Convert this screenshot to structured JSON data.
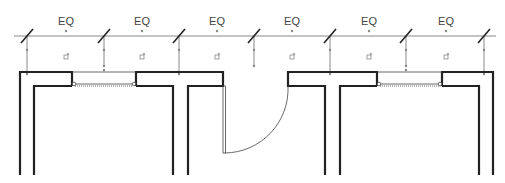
{
  "drawing": {
    "type": "architectural floor plan",
    "dimension_labels": [
      {
        "text": "EQ",
        "x": 66
      },
      {
        "text": "EQ",
        "x": 142
      },
      {
        "text": "EQ",
        "x": 217
      },
      {
        "text": "EQ",
        "x": 292
      },
      {
        "text": "EQ",
        "x": 369
      },
      {
        "text": "EQ",
        "x": 446
      }
    ],
    "dimension_ticks_x": [
      27,
      104,
      179,
      254,
      330,
      406,
      484
    ],
    "colors": {
      "line": "#222222",
      "dimension": "#777777",
      "background": "#ffffff"
    }
  }
}
